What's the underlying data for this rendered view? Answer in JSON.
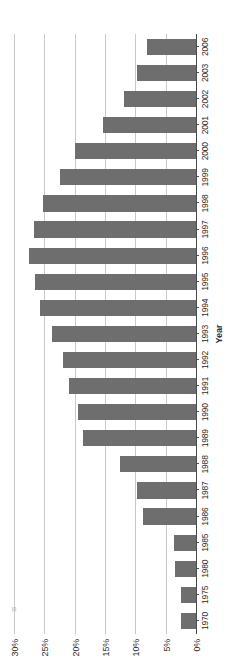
{
  "chart_data": {
    "type": "bar",
    "orientation": "vertical-rendered-rotated",
    "title": "",
    "xlabel": "Year",
    "ylabel": "",
    "ylim": [
      0,
      30
    ],
    "yticks": [
      "0%",
      "5%",
      "10%",
      "15%",
      "20%",
      "25%",
      "30%"
    ],
    "ytick_values": [
      0,
      5,
      10,
      15,
      20,
      25,
      30
    ],
    "grid": true,
    "legend": null,
    "bar_color": "#6e6e6e",
    "categories": [
      "1970",
      "1975",
      "1980",
      "1985",
      "1986",
      "1987",
      "1988",
      "1989",
      "1990",
      "1991",
      "1992",
      "1993",
      "1994",
      "1995",
      "1996",
      "1997",
      "1998",
      "1999",
      "2000",
      "2001",
      "2002",
      "2003",
      "2006"
    ],
    "values": [
      2.5,
      2.5,
      3.5,
      3.7,
      8.7,
      9.8,
      12.6,
      18.6,
      19.4,
      20.9,
      22.0,
      23.8,
      25.7,
      26.5,
      27.6,
      26.7,
      25.2,
      22.4,
      20.0,
      15.4,
      11.8,
      9.8,
      8.0
    ]
  },
  "axis": {
    "x_title": "Year"
  },
  "artifacts": {
    "scan_smudge": "≡"
  }
}
